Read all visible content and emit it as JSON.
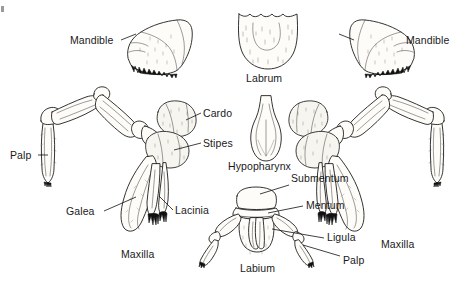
{
  "figure": {
    "background_color": "#ffffff",
    "ink_color": "#1d1d1d",
    "fill_color": "#fdfcf8",
    "width": 475,
    "height": 283
  },
  "labels": {
    "mandible_left": "Mandible",
    "mandible_right": "Mandible",
    "labrum": "Labrum",
    "cardo": "Cardo",
    "stipes": "Stipes",
    "palp_left": "Palp",
    "galea": "Galea",
    "lacinia": "Lacinia",
    "maxilla_left": "Maxilla",
    "maxilla_right": "Maxilla",
    "hypopharynx": "Hypopharynx",
    "submentum": "Submentum",
    "mentum": "Mentum",
    "ligula": "Ligula",
    "labium": "Labium",
    "palp_labial": "Palp"
  },
  "parts": {
    "mandible_left": "left mandible drawing",
    "mandible_right": "right mandible drawing",
    "labrum": "labrum drawing",
    "hypopharynx": "hypopharynx drawing",
    "maxilla_left": "left maxilla drawing",
    "maxilla_right": "right maxilla drawing",
    "labium": "labium drawing"
  }
}
